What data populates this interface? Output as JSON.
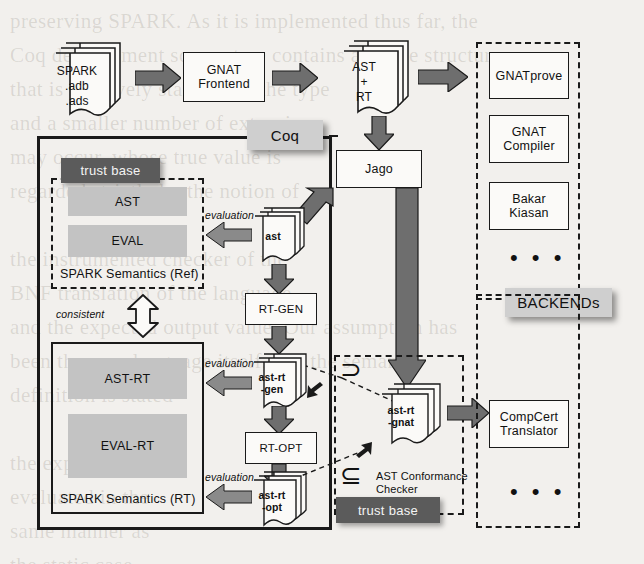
{
  "diagram": {
    "colors": {
      "page_background": "#f2f0ed",
      "gray_bar": "#c3c3c3",
      "dark_chip": "#5b5b5b",
      "light_chip": "#cfcfcf",
      "arrow_fill": "#6e6e6e",
      "stroke": "#1a1a1a"
    },
    "pipeline": {
      "source_docs": {
        "name": "spark-source-docs",
        "lines": [
          "SPARK",
          ".adb",
          ".ads"
        ]
      },
      "frontend": {
        "name": "gnat-frontend",
        "label": "GNAT\nFrontend",
        "line1": "GNAT",
        "line2": "Frontend"
      },
      "ast_rt_docs": {
        "name": "ast-plus-rt-docs",
        "lines": [
          "AST",
          "+",
          "RT"
        ]
      },
      "jago": {
        "name": "jago-box",
        "label": "Jago"
      }
    },
    "coq": {
      "group_label": "Coq",
      "trust_base_label": "trust base",
      "ref_semantics": {
        "caption": "SPARK Semantics (Ref)",
        "bars": [
          {
            "name": "ast-bar",
            "label": "AST"
          },
          {
            "name": "eval-bar",
            "label": "EVAL"
          }
        ]
      },
      "rt_semantics": {
        "caption": "SPARK Semantics (RT)",
        "bars": [
          {
            "name": "ast-rt-bar",
            "label": "AST-RT"
          },
          {
            "name": "eval-rt-bar",
            "label": "EVAL-RT"
          }
        ]
      },
      "consistent_label": "consistent",
      "evaluation_labels": [
        "evaluation",
        "evaluation",
        "evaluation"
      ],
      "center_chain": [
        {
          "type": "doc",
          "name": "ast-doc",
          "label": "ast"
        },
        {
          "type": "process",
          "name": "rt-gen-box",
          "label": "RT-GEN"
        },
        {
          "type": "doc",
          "name": "ast-rt-gen-doc",
          "line1": "ast-rt",
          "line2": "-gen"
        },
        {
          "type": "process",
          "name": "rt-opt-box",
          "label": "RT-OPT"
        },
        {
          "type": "doc",
          "name": "ast-rt-opt-doc",
          "line1": "ast-rt",
          "line2": "-opt"
        }
      ]
    },
    "checker": {
      "gnat_doc": {
        "name": "ast-rt-gnat-doc",
        "line1": "ast-rt",
        "line2": "-gnat"
      },
      "caption_line1": "AST Conformance",
      "caption_line2": "Checker",
      "trust_base_label": "trust base",
      "superset_symbol": "⊃",
      "subset_symbol": "⊆"
    },
    "backends": {
      "group_label": "BACKENDs",
      "top_group": {
        "items": [
          {
            "name": "gnatprove-box",
            "label": "GNATprove"
          },
          {
            "name": "gnat-compiler-box",
            "line1": "GNAT",
            "line2": "Compiler"
          },
          {
            "name": "bakar-kiasan-box",
            "line1": "Bakar",
            "line2": "Kiasan"
          }
        ],
        "ellipsis": "• • •"
      },
      "bottom_group": {
        "items": [
          {
            "name": "compcert-translator-box",
            "line1": "CompCert",
            "line2": "Translator"
          }
        ],
        "ellipsis": "• • •"
      }
    }
  },
  "ghost_text": "preserving SPARK. As it is implemented thus far, the\nCoq development source tree contains a single structure\nthat is relatively stable with the type\nand a smaller number of extensions\nmay occur, whose true value is\nregarded strictly by the notion of\n\nthe instrumented checker of the\nBNF translation of the language\nand the expected output value. Our assumption has\nbeen the core language itself, and the semantic\ndefinition is stated\n\nthe expression is\nevaluated in the\nsame manner as\nthe static case\n\n2.4 The Gallina stage of the process"
}
